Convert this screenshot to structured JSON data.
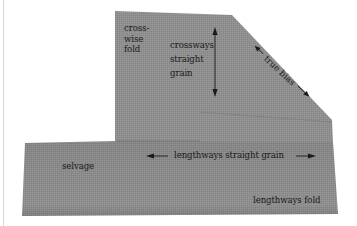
{
  "figure": {
    "background": "#ffffff",
    "fabric_color": "#8e8e8e",
    "fabric_shade_color": "#7c7c7c",
    "text_color": "#1a1a1a"
  },
  "labels": {
    "crosswise_fold": [
      "cross-",
      "wise",
      "fold"
    ],
    "crossways_straight_grain": [
      "crossways",
      "straight",
      "grain"
    ],
    "true_bias": "true bias",
    "selvage": "selvage",
    "lengthways_straight_grain": "lengthways straight grain",
    "lengthways_fold": "lengthways fold"
  },
  "arrows": {
    "crossways_grain": "double-headed vertical arrow",
    "true_bias": "double-headed diagonal arrow",
    "lengthways_grain": "double-headed horizontal arrow"
  }
}
